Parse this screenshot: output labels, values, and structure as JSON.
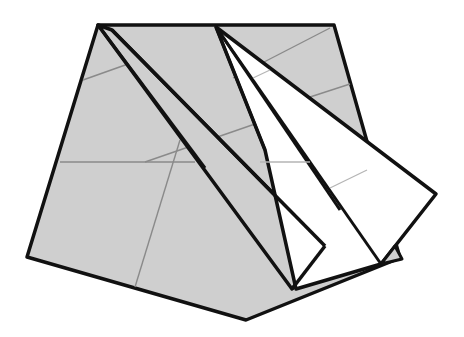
{
  "diagram": {
    "type": "origami-fold-step",
    "colors": {
      "paper_gray": "#cfcfcf",
      "paper_white": "#ffffff",
      "outline": "#111111",
      "crease": "#8a8a8a",
      "crease_light": "#b5b5b5",
      "background": "#ffffff"
    },
    "labels": []
  }
}
